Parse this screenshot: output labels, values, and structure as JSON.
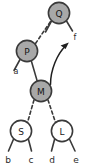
{
  "figure": {
    "type": "binary-tree-diagram",
    "background_color": "#ffffff",
    "stroke_color": "#3a3a3a",
    "filled_node_color": "#a8a8a8",
    "hollow_node_color": "#ffffff"
  },
  "nodes": [
    {
      "id": "Q",
      "label": "Q",
      "fill": "filled",
      "cx": 59,
      "cy": 13,
      "r": 11
    },
    {
      "id": "P",
      "label": "P",
      "fill": "filled",
      "cx": 27,
      "cy": 51,
      "r": 11
    },
    {
      "id": "M",
      "label": "M",
      "fill": "filled",
      "cx": 41,
      "cy": 91,
      "r": 11
    },
    {
      "id": "S",
      "label": "S",
      "fill": "hollow",
      "cx": 21,
      "cy": 131,
      "r": 11
    },
    {
      "id": "L",
      "label": "L",
      "fill": "hollow",
      "cx": 62,
      "cy": 131,
      "r": 11
    }
  ],
  "edge_labels": [
    {
      "id": "a",
      "label": "a",
      "x": 16,
      "y": 71
    },
    {
      "id": "f",
      "label": "f",
      "x": 75,
      "y": 37
    }
  ],
  "leaf_labels": [
    {
      "id": "b",
      "label": "b",
      "x": 8,
      "y": 160
    },
    {
      "id": "c",
      "label": "c",
      "x": 31,
      "y": 160
    },
    {
      "id": "d",
      "label": "d",
      "x": 52,
      "y": 160
    },
    {
      "id": "e",
      "label": "e",
      "x": 76,
      "y": 160
    }
  ],
  "edges": [
    {
      "id": "P-Q",
      "from": "P",
      "to": "Q",
      "style": "dashed"
    },
    {
      "id": "P-M",
      "from": "P",
      "to": "M",
      "style": "solid"
    },
    {
      "id": "M-S",
      "from": "M",
      "to": "S",
      "style": "dashed"
    },
    {
      "id": "M-L",
      "from": "M",
      "to": "L",
      "style": "dashed"
    }
  ],
  "annotation": {
    "id": "rotation-arrow",
    "label": "",
    "description": "curved arrow from M upward to f"
  }
}
